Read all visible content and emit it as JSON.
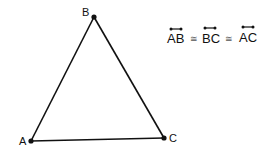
{
  "diagram": {
    "type": "equilateral-triangle",
    "vertices": [
      {
        "label": "A",
        "x": 31,
        "y": 141,
        "label_x": 19,
        "label_y": 145
      },
      {
        "label": "B",
        "x": 94,
        "y": 17,
        "label_x": 82,
        "label_y": 16
      },
      {
        "label": "C",
        "x": 164,
        "y": 138,
        "label_x": 169,
        "label_y": 142
      }
    ],
    "statement": {
      "segments": [
        "AB",
        "BC",
        "AC"
      ],
      "relation_symbol": "≅"
    },
    "colors": {
      "stroke": "#111111",
      "background": "#ffffff"
    }
  }
}
